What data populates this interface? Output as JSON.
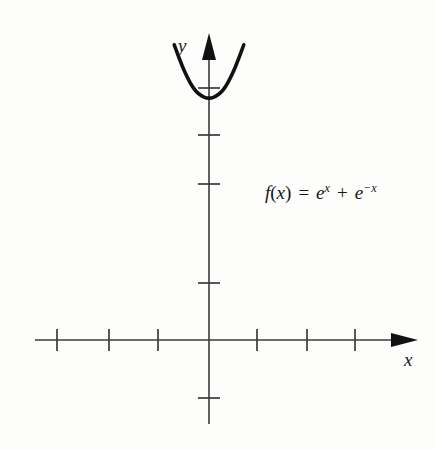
{
  "figure": {
    "kind": "cartesian-plot",
    "background_color": "#fdfdfc",
    "curve_color": "#111111",
    "axis_color": "#333333"
  },
  "axes": {
    "x_label": "x",
    "y_label": "y",
    "x_axis": {
      "start_px": 35,
      "end_px": 418,
      "y_px": 340,
      "arrow": "right",
      "tick_positions_px": [
        57,
        109,
        158,
        257,
        307,
        355
      ],
      "tick_half_height_px": 11
    },
    "y_axis": {
      "top_px": 33,
      "bottom_px": 424,
      "x_px": 209,
      "arrow": "up",
      "tick_positions_px": [
        88,
        135,
        184,
        283,
        398
      ],
      "tick_half_width_px": 11
    }
  },
  "annotation": {
    "function_text": "f(x) = e^x + e^-x",
    "parts": {
      "f": "f",
      "open_paren": "(",
      "var1": "x",
      "close_paren": ")",
      "equals": "=",
      "e1": "e",
      "exp1": "x",
      "plus": "+",
      "e2": "e",
      "exp2": "−x"
    }
  },
  "chart_data": {
    "type": "line",
    "title": "",
    "xlabel": "x",
    "ylabel": "y",
    "legend": [
      "f(x) = e^x + e^-x"
    ],
    "function": "f(x) = e^x + e^(-x)",
    "equivalent": "2*cosh(x)",
    "grid": false,
    "xlim": [
      -3.5,
      4.3
    ],
    "ylim": [
      -2,
      6.2
    ],
    "x_tick_values": [
      -3,
      -2,
      -1,
      1,
      2,
      3
    ],
    "y_tick_values": [
      1,
      2,
      3,
      5,
      6
    ],
    "vertex": {
      "x": 0,
      "y": 2
    },
    "x": [
      -2.1,
      -1.9,
      -1.7,
      -1.5,
      -1.3,
      -1.1,
      -0.9,
      -0.7,
      -0.5,
      -0.3,
      -0.1,
      0.1,
      0.3,
      0.5,
      0.7,
      0.9,
      1.1,
      1.3,
      1.5,
      1.7,
      1.9,
      2.1
    ],
    "values": [
      8.33,
      6.99,
      5.9,
      5.01,
      4.28,
      3.7,
      3.24,
      2.88,
      2.63,
      2.45,
      2.37,
      2.37,
      2.45,
      2.63,
      2.88,
      3.24,
      3.7,
      4.28,
      5.01,
      5.9,
      6.99,
      8.33
    ]
  }
}
